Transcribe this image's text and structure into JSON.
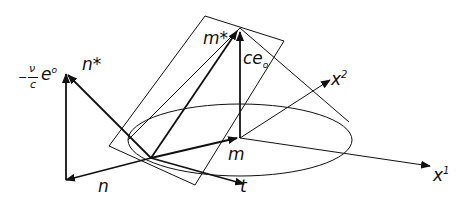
{
  "figure": {
    "labels": {
      "n_star": "n*",
      "m_star": "m*",
      "ce0": "ce",
      "ce0_sub": "o",
      "x2": "x",
      "x2_sup": "2",
      "x1": "x",
      "x1_sup": "1",
      "m": "m",
      "n": "n",
      "t": "t",
      "e0_minus": "−",
      "e0_num": "ν",
      "e0_den": "c",
      "e0_e": "e",
      "e0_sup": "o"
    },
    "colors": {
      "ink": "#111111",
      "background": "#ffffff"
    }
  }
}
